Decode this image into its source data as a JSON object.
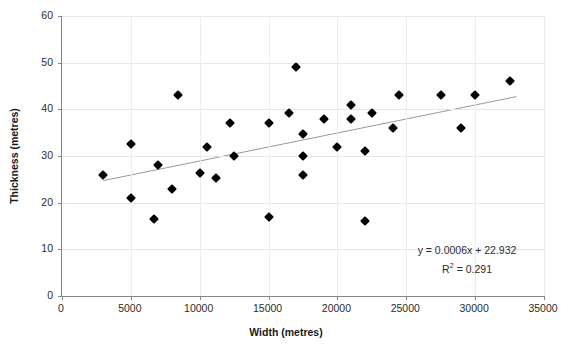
{
  "chart_data": {
    "type": "scatter",
    "title": "",
    "xlabel": "Width (metres)",
    "ylabel": "Thickness (metres)",
    "xlim": [
      0,
      35000
    ],
    "ylim": [
      0,
      60
    ],
    "xticks": [
      0,
      5000,
      10000,
      15000,
      20000,
      25000,
      30000,
      35000
    ],
    "xtick_labels": [
      "0",
      "5000",
      "10000",
      "15000",
      "20000",
      "25000",
      "30000",
      "35000"
    ],
    "yticks": [
      0,
      10,
      20,
      30,
      40,
      50,
      60
    ],
    "ytick_labels": [
      "0",
      "10",
      "20",
      "30",
      "40",
      "50",
      "60"
    ],
    "grid": true,
    "legend": false,
    "marker_style": "filled-diamond",
    "marker_color": "#000000",
    "trendline": {
      "type": "linear",
      "slope": 0.0006,
      "intercept": 22.932,
      "r_squared": 0.291,
      "x_start": 3000,
      "x_end": 33000,
      "color": "#999999"
    },
    "points": [
      {
        "x": 3000,
        "y": 26.0
      },
      {
        "x": 5000,
        "y": 32.5
      },
      {
        "x": 5000,
        "y": 21.0
      },
      {
        "x": 6700,
        "y": 16.5
      },
      {
        "x": 7000,
        "y": 28.0
      },
      {
        "x": 8000,
        "y": 23.0
      },
      {
        "x": 8400,
        "y": 43.0
      },
      {
        "x": 10000,
        "y": 26.3
      },
      {
        "x": 10500,
        "y": 32.0
      },
      {
        "x": 11200,
        "y": 25.3
      },
      {
        "x": 12200,
        "y": 37.0
      },
      {
        "x": 12500,
        "y": 30.0
      },
      {
        "x": 15000,
        "y": 37.0
      },
      {
        "x": 15000,
        "y": 17.0
      },
      {
        "x": 16500,
        "y": 39.3
      },
      {
        "x": 17000,
        "y": 49.0
      },
      {
        "x": 17500,
        "y": 34.7
      },
      {
        "x": 17500,
        "y": 30.0
      },
      {
        "x": 17500,
        "y": 26.0
      },
      {
        "x": 19000,
        "y": 38.0
      },
      {
        "x": 20000,
        "y": 32.0
      },
      {
        "x": 21000,
        "y": 41.0
      },
      {
        "x": 21000,
        "y": 38.0
      },
      {
        "x": 22000,
        "y": 31.0
      },
      {
        "x": 22000,
        "y": 16.0
      },
      {
        "x": 22500,
        "y": 39.3
      },
      {
        "x": 24000,
        "y": 36.0
      },
      {
        "x": 24500,
        "y": 43.0
      },
      {
        "x": 27500,
        "y": 43.0
      },
      {
        "x": 29000,
        "y": 36.0
      },
      {
        "x": 30000,
        "y": 43.0
      },
      {
        "x": 32500,
        "y": 46.0
      }
    ],
    "annotations": {
      "equation": "y = 0.0006x + 22.932",
      "r_squared_prefix": "R",
      "r_squared_sup": "2",
      "r_squared_value": " = 0.291"
    }
  }
}
